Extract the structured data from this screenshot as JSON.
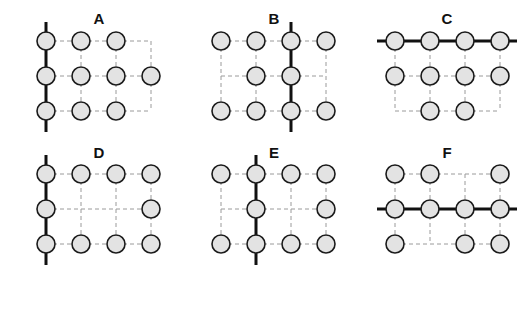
{
  "figure": {
    "colors": {
      "node_fill": "#e3e3e3",
      "node_stroke": "#1a1a1a",
      "dashed_edge": "#9a9a9a",
      "bold_line": "#111111",
      "background": "#ffffff"
    },
    "grid": {
      "rows": 3,
      "cols": 4,
      "spacing": 35,
      "node_radius": 9
    },
    "panels": [
      {
        "label": "A",
        "origin": [
          46,
          41
        ],
        "title_pos": [
          99,
          19
        ],
        "nodes": [
          [
            1,
            1,
            1,
            0
          ],
          [
            1,
            1,
            1,
            1
          ],
          [
            1,
            1,
            1,
            0
          ]
        ],
        "bold": {
          "type": "col",
          "index": 0
        }
      },
      {
        "label": "B",
        "origin": [
          221,
          41
        ],
        "title_pos": [
          274,
          19
        ],
        "nodes": [
          [
            1,
            1,
            1,
            1
          ],
          [
            0,
            1,
            1,
            0
          ],
          [
            1,
            1,
            1,
            1
          ]
        ],
        "bold": {
          "type": "col",
          "index": 2
        }
      },
      {
        "label": "C",
        "origin": [
          395,
          41
        ],
        "title_pos": [
          447,
          19
        ],
        "nodes": [
          [
            1,
            1,
            1,
            1
          ],
          [
            1,
            1,
            1,
            1
          ],
          [
            0,
            1,
            1,
            0
          ]
        ],
        "bold": {
          "type": "row",
          "index": 0
        }
      },
      {
        "label": "D",
        "origin": [
          46,
          174
        ],
        "title_pos": [
          99,
          153
        ],
        "nodes": [
          [
            1,
            1,
            1,
            1
          ],
          [
            1,
            0,
            0,
            1
          ],
          [
            1,
            1,
            1,
            1
          ]
        ],
        "bold": {
          "type": "col",
          "index": 0
        }
      },
      {
        "label": "E",
        "origin": [
          221,
          174
        ],
        "title_pos": [
          274,
          153
        ],
        "nodes": [
          [
            1,
            1,
            1,
            1
          ],
          [
            0,
            1,
            0,
            1
          ],
          [
            1,
            1,
            1,
            1
          ]
        ],
        "bold": {
          "type": "col",
          "index": 1
        }
      },
      {
        "label": "F",
        "origin": [
          395,
          174
        ],
        "title_pos": [
          447,
          153
        ],
        "nodes": [
          [
            1,
            1,
            0,
            1
          ],
          [
            1,
            1,
            1,
            1
          ],
          [
            1,
            0,
            1,
            1
          ]
        ],
        "bold": {
          "type": "row",
          "index": 1
        }
      }
    ]
  }
}
